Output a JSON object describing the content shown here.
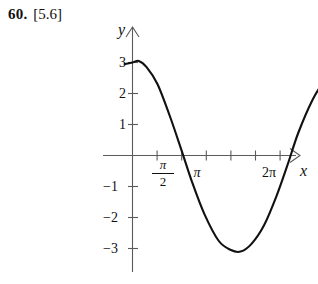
{
  "exercise": {
    "number": "60.",
    "reference": "[5.6]"
  },
  "figure": {
    "axis_labels": {
      "x": "x",
      "y": "y"
    },
    "y_ticks": [
      {
        "label": "3",
        "value": 3
      },
      {
        "label": "2",
        "value": 2
      },
      {
        "label": "1",
        "value": 1
      },
      {
        "label": "−1",
        "value": -1
      },
      {
        "label": "−2",
        "value": -2
      },
      {
        "label": "−3",
        "value": -3
      }
    ],
    "x_ticks": [
      {
        "label": "π/2",
        "numerator": "π",
        "denominator": "2"
      },
      {
        "label": "π"
      },
      {
        "label": "2π"
      }
    ]
  },
  "chart_data": {
    "type": "line",
    "title": "",
    "xlabel": "x",
    "ylabel": "y",
    "xlim": [
      -0.3,
      7.4
    ],
    "ylim": [
      -3.6,
      3.6
    ],
    "grid": false,
    "legend": null,
    "curve_description": "Cosine-type wave of amplitude about 3, starting near y = 3 at x = 0, crossing zero just past pi/2, reaching a minimum of about -3.1 near x = 3.4, crossing zero again near x = 4.9, and rising to about 2.9 at the right end.",
    "x_tick_values": [
      1.5707963,
      3.1415927,
      6.2831853
    ],
    "x_tick_labels": [
      "π/2",
      "π",
      "2π"
    ],
    "y_tick_values": [
      3,
      2,
      1,
      -1,
      -2,
      -3
    ],
    "y_tick_labels": [
      "3",
      "2",
      "1",
      "−1",
      "−2",
      "−3"
    ],
    "series": [
      {
        "name": "y = 3 cos x",
        "x": [
          -0.25,
          0.0,
          0.2,
          0.45,
          0.8,
          1.2,
          1.571,
          1.9,
          2.3,
          2.75,
          3.142,
          3.45,
          3.8,
          4.2,
          4.6,
          4.95,
          5.3,
          5.75,
          6.1,
          6.5,
          6.9,
          7.15
        ],
        "y": [
          2.95,
          3.0,
          3.05,
          2.85,
          2.3,
          1.25,
          0.15,
          -0.85,
          -1.9,
          -2.75,
          -3.05,
          -3.1,
          -2.85,
          -2.25,
          -1.3,
          -0.3,
          0.75,
          1.8,
          2.35,
          2.7,
          2.88,
          2.9
        ]
      }
    ]
  }
}
